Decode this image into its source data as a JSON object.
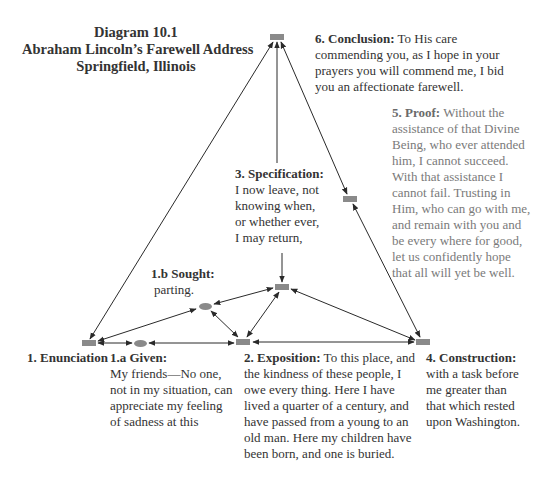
{
  "title": {
    "line1": "Diagram 10.1",
    "line2": "Abraham Lincoln’s Farewell Address",
    "line3": "Springfield, Illinois"
  },
  "nodes": {
    "conclusion": {
      "label": "6. Conclusion:",
      "lines": [
        "To His care",
        "commending you, as I hope in your",
        "prayers you will commend me, I bid",
        "you an affectionate farewell."
      ]
    },
    "proof": {
      "label": "5. Proof:",
      "lines": [
        "Without the",
        "assistance of that Divine",
        "Being, who ever attended",
        "him, I cannot succeed.",
        "With that assistance I",
        "cannot fail. Trusting in",
        "Him, who can go with me,",
        "and remain with you and",
        "be every where for good,",
        "let us confidently hope",
        "that all will yet be well."
      ]
    },
    "specification": {
      "label": "3. Specification:",
      "lines": [
        "I now leave, not",
        "knowing when,",
        "or whether ever,",
        "I may return,"
      ]
    },
    "sought": {
      "label": "1.b Sought:",
      "lines": [
        "parting."
      ]
    },
    "enunciation": {
      "label": "1. Enunciation"
    },
    "given": {
      "label": "1.a Given:",
      "lines": [
        "My friends—No one,",
        "not in my situation, can",
        "appreciate my feeling",
        "of sadness at this"
      ]
    },
    "exposition": {
      "label": "2. Exposition:",
      "lines": [
        "To this place, and",
        "the kindness of these people, I",
        "owe every thing. Here I have",
        "lived a quarter of a century, and",
        "have passed from a young to an",
        "old man. Here my children have",
        "been born, and one is buried."
      ]
    },
    "construction": {
      "label": "4. Construction:",
      "lines": [
        "with a task before",
        "me greater than",
        "that which rested",
        "upon Washington."
      ]
    }
  },
  "colors": {
    "node_fill": "#8a8a8a",
    "edge": "#2a2a2a",
    "text_dark": "#333333",
    "text_light": "#7a7a7a"
  },
  "edges": [
    {
      "from": "enunciation",
      "to": "conclusion",
      "arrows": "both"
    },
    {
      "from": "specification",
      "to": "conclusion",
      "arrows": "end"
    },
    {
      "from": "proof",
      "to": "conclusion",
      "arrows": "both"
    },
    {
      "from": "construction",
      "to": "proof",
      "arrows": "both"
    },
    {
      "from": "specification",
      "to": "construction",
      "arrows": "both"
    },
    {
      "from": "exposition",
      "to": "construction",
      "arrows": "both"
    },
    {
      "from": "enunciation",
      "to": "given",
      "arrows": "both"
    },
    {
      "from": "given",
      "to": "exposition",
      "arrows": "both"
    },
    {
      "from": "enunciation",
      "to": "sought",
      "arrows": "both"
    },
    {
      "from": "sought",
      "to": "specification",
      "arrows": "both"
    },
    {
      "from": "sought",
      "to": "exposition",
      "arrows": "both"
    },
    {
      "from": "exposition",
      "to": "specification",
      "arrows": "both"
    },
    {
      "from": "specification-text",
      "to": "specification",
      "arrows": "end"
    }
  ]
}
